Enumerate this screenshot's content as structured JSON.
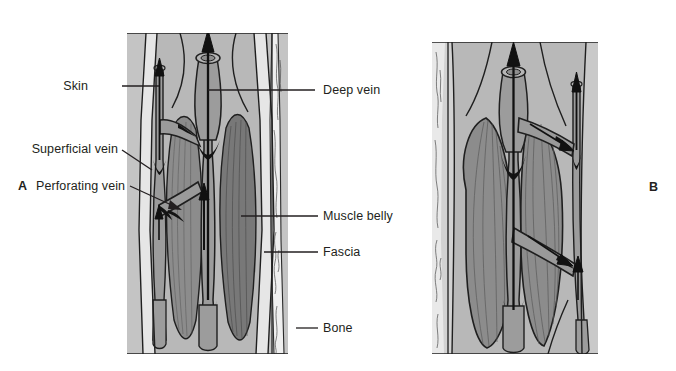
{
  "figure": {
    "type": "anatomical-diagram",
    "panels": [
      {
        "id": "A",
        "letter": "A",
        "state": "muscle relaxed",
        "description": "Longitudinal section of leg showing skin, superficial vein, perforating vein, deep vein, muscle bellies, fascia and bone with relaxed muscle"
      },
      {
        "id": "B",
        "letter": "B",
        "state": "muscle contracted",
        "description": "Mirrored longitudinal section with contracted bulging muscle bellies compressing the deep vein, driving blood proximally"
      }
    ]
  },
  "labels_left": [
    {
      "key": "skin",
      "text": "Skin"
    },
    {
      "key": "superficial-vein",
      "text": "Superficial vein"
    },
    {
      "key": "perforating-vein",
      "text": "Perforating vein"
    }
  ],
  "labels_right": [
    {
      "key": "deep-vein",
      "text": "Deep vein"
    },
    {
      "key": "muscle-belly",
      "text": "Muscle belly"
    },
    {
      "key": "fascia",
      "text": "Fascia"
    },
    {
      "key": "bone",
      "text": "Bone"
    }
  ],
  "colors": {
    "background": "#ffffff",
    "ink": "#231f20",
    "skin_layer": "#c9c9c9",
    "subcutaneous": "#d6d6d6",
    "fascia_light": "#e9e9e9",
    "muscle": "#8c8c8c",
    "muscle_dark": "#7a7a7a",
    "vein_lumen": "#9a9a9a",
    "bone": "#efefef",
    "valve_black": "#1a1a1a"
  },
  "arrows": {
    "count_panel_a": 4,
    "count_panel_b": 5,
    "meaning": "direction of venous blood flow"
  }
}
